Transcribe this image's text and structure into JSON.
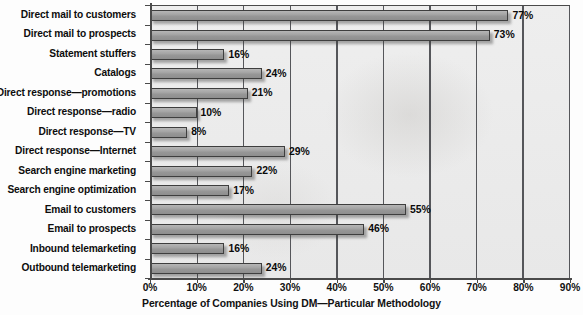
{
  "chart_data": {
    "type": "bar",
    "orientation": "horizontal",
    "title": "",
    "xlabel": "Percentage of Companies Using DM—Particular Methodology",
    "ylabel": "",
    "xlim": [
      0,
      90
    ],
    "xtick_labels": [
      "0%",
      "10%",
      "20%",
      "30%",
      "40%",
      "50%",
      "60%",
      "70%",
      "80%",
      "90%"
    ],
    "xtick_values": [
      0,
      10,
      20,
      30,
      40,
      50,
      60,
      70,
      80,
      90
    ],
    "grid": true,
    "legend": null,
    "categories": [
      "Direct mail to customers",
      "Direct mail to prospects",
      "Statement stuffers",
      "Catalogs",
      "Direct response—promotions",
      "Direct response—radio",
      "Direct response—TV",
      "Direct response—Internet",
      "Search engine marketing",
      "Search engine optimization",
      "Email to customers",
      "Email to prospects",
      "Inbound telemarketing",
      "Outbound telemarketing"
    ],
    "values": [
      77,
      73,
      16,
      24,
      21,
      10,
      8,
      29,
      22,
      17,
      55,
      46,
      16,
      24
    ],
    "data_labels": [
      "77%",
      "73%",
      "16%",
      "24%",
      "21%",
      "10%",
      "8%",
      "29%",
      "22%",
      "17%",
      "55%",
      "46%",
      "16%",
      "24%"
    ],
    "colors": {
      "bar_fill": "#a2a2a2",
      "bar_border": "#3e3e3e",
      "plot_background": "#ebebeb",
      "axis": "#4a4a4a",
      "gridline": "#55565a",
      "text": "#0d0d0d"
    }
  }
}
